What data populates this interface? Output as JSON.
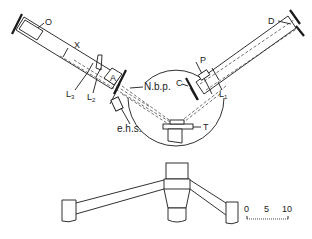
{
  "figure": {
    "stroke_color": "#1a1a1a",
    "background": "#ffffff"
  },
  "labels": {
    "O": "O",
    "X": "X",
    "L3": {
      "main": "L",
      "sub": "3"
    },
    "L2": {
      "main": "L",
      "sub": "2"
    },
    "A": "A",
    "Nbp": "N.b.p.",
    "ehs": "e.h.s.",
    "T": "T",
    "C": "C",
    "P": "P",
    "L1": {
      "main": "L",
      "sub": "1"
    },
    "D": "D"
  },
  "scale_bar": {
    "ticks": [
      "0",
      "5",
      "10"
    ]
  }
}
